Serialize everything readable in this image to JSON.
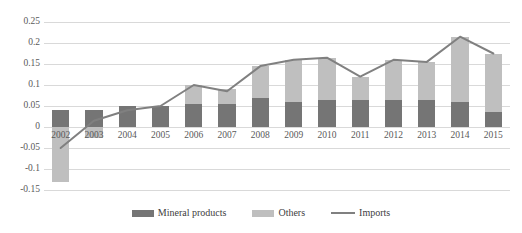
{
  "chart_data": {
    "type": "bar",
    "title": "",
    "subtitle": "",
    "xlabel": "",
    "ylabel": "",
    "categories": [
      "2002",
      "2003",
      "2004",
      "2005",
      "2006",
      "2007",
      "2008",
      "2009",
      "2010",
      "2011",
      "2012",
      "2013",
      "2014",
      "2015"
    ],
    "ylim": [
      -0.15,
      0.25
    ],
    "yticks": [
      0.25,
      0.2,
      0.15,
      0.1,
      0.05,
      0,
      -0.05,
      -0.1,
      -0.15
    ],
    "ytick_labels": [
      "0.25",
      "0.2",
      "0.15",
      "0.1",
      "0.05",
      "0",
      "-0.05",
      "-0.1",
      "-0.15"
    ],
    "grid": true,
    "stacked": true,
    "legend_position": "bottom",
    "series": [
      {
        "name": "Mineral products",
        "type": "bar",
        "color": "#757575",
        "values": [
          0.04,
          0.04,
          0.05,
          0.05,
          0.055,
          0.055,
          0.07,
          0.06,
          0.065,
          0.065,
          0.065,
          0.065,
          0.06,
          0.035
        ]
      },
      {
        "name": "Others",
        "type": "bar",
        "color": "#bfbfbf",
        "values": [
          -0.13,
          -0.025,
          0.0,
          0.0,
          0.045,
          0.035,
          0.075,
          0.1,
          0.1,
          0.055,
          0.095,
          0.09,
          0.155,
          0.14
        ]
      },
      {
        "name": "Imports",
        "type": "line",
        "color": "#808080",
        "values": [
          -0.05,
          0.015,
          0.04,
          0.05,
          0.1,
          0.085,
          0.145,
          0.16,
          0.165,
          0.12,
          0.16,
          0.155,
          0.215,
          0.175
        ]
      }
    ],
    "totals": [
      -0.09,
      0.015,
      0.05,
      0.05,
      0.1,
      0.09,
      0.145,
      0.16,
      0.165,
      0.12,
      0.16,
      0.155,
      0.215,
      0.175
    ]
  },
  "legend": {
    "items": [
      {
        "label": "Mineral products",
        "color": "#757575",
        "marker": "swatch"
      },
      {
        "label": "Others",
        "color": "#bfbfbf",
        "marker": "swatch"
      },
      {
        "label": "Imports",
        "color": "#808080",
        "marker": "line"
      }
    ]
  },
  "colors": {
    "mineral": "#757575",
    "others": "#bfbfbf",
    "imports": "#808080",
    "grid": "#d9d9d9",
    "axis_text": "#595959",
    "background": "#ffffff"
  }
}
